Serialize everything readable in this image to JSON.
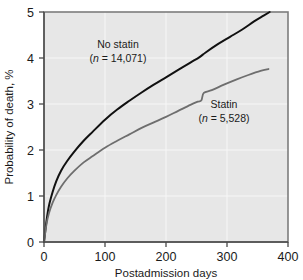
{
  "chart_data": {
    "type": "line",
    "title": "",
    "xlabel": "Postadmission days",
    "ylabel": "Probability of death, %",
    "xlim": [
      0,
      400
    ],
    "ylim": [
      0,
      5
    ],
    "xticks": [
      "0",
      "100",
      "200",
      "300",
      "400"
    ],
    "xtick_values": [
      0,
      100,
      200,
      300,
      400
    ],
    "yticks": [
      "0",
      "1",
      "2",
      "3",
      "4",
      "5"
    ],
    "ytick_values": [
      0,
      1,
      2,
      3,
      4,
      5
    ],
    "grid": true,
    "legend": "annotations-on-plot",
    "background_color": "#e7e7e7",
    "gridline_color": "#f7f7f7",
    "series": [
      {
        "name": "No statin",
        "label_line1": "No statin",
        "label_line2_prefix": "(",
        "label_line2_italic": "n",
        "label_line2_suffix": " = 14,071)",
        "n": 14071,
        "color": "#111111",
        "stroke_width": 2.0,
        "x": [
          0,
          4,
          8,
          14,
          20,
          28,
          38,
          50,
          65,
          80,
          100,
          120,
          140,
          160,
          180,
          200,
          220,
          240,
          255,
          265,
          285,
          305,
          325,
          345,
          360,
          370
        ],
        "y": [
          0,
          0.45,
          0.78,
          1.08,
          1.32,
          1.55,
          1.76,
          1.97,
          2.2,
          2.4,
          2.66,
          2.88,
          3.07,
          3.25,
          3.42,
          3.58,
          3.74,
          3.9,
          4.02,
          4.12,
          4.3,
          4.46,
          4.62,
          4.8,
          4.92,
          5.0
        ]
      },
      {
        "name": "Statin",
        "label_line1": "Statin",
        "label_line2_prefix": "(",
        "label_line2_italic": "n",
        "label_line2_suffix": " = 5,528)",
        "n": 5528,
        "color": "#6e6e6e",
        "stroke_width": 1.8,
        "x": [
          0,
          4,
          8,
          14,
          20,
          28,
          38,
          50,
          65,
          80,
          100,
          120,
          140,
          160,
          180,
          200,
          220,
          240,
          252,
          258,
          262,
          275,
          295,
          315,
          335,
          355,
          368
        ],
        "y": [
          0,
          0.38,
          0.62,
          0.85,
          1.02,
          1.2,
          1.38,
          1.55,
          1.73,
          1.87,
          2.05,
          2.2,
          2.34,
          2.48,
          2.6,
          2.72,
          2.85,
          2.98,
          3.05,
          3.08,
          3.24,
          3.3,
          3.42,
          3.53,
          3.63,
          3.72,
          3.76
        ]
      }
    ],
    "annotations": [
      {
        "name": "no-statin-label",
        "x_px": 115,
        "y_px": 50,
        "text_line1": "No statin",
        "text_line2": "(n = 14,071)"
      },
      {
        "name": "statin-label",
        "x_px": 222,
        "y_px": 110,
        "text_line1": "Statin",
        "text_line2": "(n = 5,528)"
      }
    ]
  },
  "axes": {
    "x_title": "Postadmission days",
    "y_title": "Probability of death, %"
  },
  "labels": {
    "no_statin_title": "No statin",
    "no_statin_n_open": "(",
    "no_statin_n_var": "n",
    "no_statin_n_rest": " = 14,071)",
    "statin_title": "Statin",
    "statin_n_open": "(",
    "statin_n_var": "n",
    "statin_n_rest": " = 5,528)"
  },
  "ticks": {
    "x": [
      "0",
      "100",
      "200",
      "300",
      "400"
    ],
    "y": [
      "0",
      "1",
      "2",
      "3",
      "4",
      "5"
    ]
  }
}
